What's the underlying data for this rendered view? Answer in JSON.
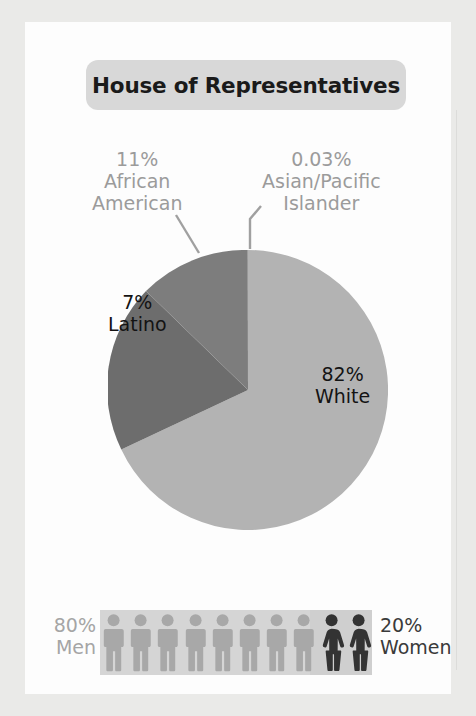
{
  "title": {
    "text": "House of Representatives"
  },
  "chart_data": {
    "type": "pie",
    "title": "House of Representatives",
    "categories": [
      "White",
      "African American",
      "Latino",
      "Asian/Pacific Islander"
    ],
    "values": [
      82,
      11,
      7,
      0.03
    ],
    "value_labels": [
      "82%",
      "11%",
      "7%",
      "0.03%"
    ],
    "colors": [
      "#b3b3b3",
      "#7d7d7d",
      "#6d6d6d",
      "#8a8a8a"
    ],
    "legend": "none",
    "grid": false,
    "start_angle_deg": 90,
    "direction": "counterclockwise",
    "secondary": {
      "type": "pictogram",
      "title": "Gender breakdown",
      "categories": [
        "Men",
        "Women"
      ],
      "values": [
        80,
        20
      ],
      "value_labels": [
        "80%",
        "20%"
      ],
      "icon_count": [
        8,
        2
      ],
      "colors": [
        "#a8a8a8",
        "#333333"
      ]
    }
  },
  "pie_labels": {
    "african_american": {
      "pct": "11%",
      "line1": "African",
      "line2": "American"
    },
    "asian_pacific": {
      "pct": "0.03%",
      "line1": "Asian/Pacific",
      "line2": "Islander"
    },
    "latino": {
      "pct": "7%",
      "name": "Latino"
    },
    "white": {
      "pct": "82%",
      "name": "White"
    }
  },
  "gender": {
    "men": {
      "pct": "80%",
      "name": "Men"
    },
    "women": {
      "pct": "20%",
      "name": "Women"
    }
  },
  "icons": {
    "man": "male-figure-icon",
    "woman": "female-figure-icon"
  },
  "colors": {
    "white_slice": "#b3b3b3",
    "african_slice": "#7d7d7d",
    "latino_slice": "#6d6d6d",
    "asian_slice": "#8a8a8a",
    "men_figure": "#a8a8a8",
    "women_figure": "#333333",
    "title_pill": "#d8d8d8",
    "muted_text": "#9b9b9b"
  }
}
